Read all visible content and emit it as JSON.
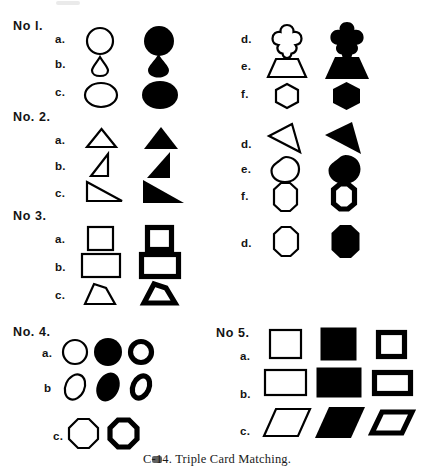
{
  "figure": {
    "caption": "C-14. Triple Card Matching.",
    "ink_color": "#000000",
    "paper_color": "#ffffff"
  },
  "groups": [
    {
      "id": "no-1",
      "label": "No l.",
      "left_column": {
        "rows": [
          {
            "label": "a.",
            "shape": "circle",
            "variants": [
              "outline",
              "solid"
            ]
          },
          {
            "label": "b.",
            "shape": "teardrop",
            "variants": [
              "outline",
              "solid"
            ]
          },
          {
            "label": "c.",
            "shape": "ellipse",
            "variants": [
              "outline",
              "solid"
            ]
          }
        ]
      },
      "right_column": {
        "rows": [
          {
            "label": "d.",
            "shape": "quatrefoil",
            "variants": [
              "outline",
              "solid"
            ]
          },
          {
            "label": "e.",
            "shape": "trapezoid",
            "variants": [
              "outline",
              "solid"
            ]
          },
          {
            "label": "f.",
            "shape": "hexagon",
            "variants": [
              "outline",
              "solid"
            ]
          }
        ]
      }
    },
    {
      "id": "no-2",
      "label": "No. 2.",
      "left_column": {
        "rows": [
          {
            "label": "a.",
            "shape": "triangle-isosceles",
            "variants": [
              "outline",
              "solid"
            ]
          },
          {
            "label": "b.",
            "shape": "triangle-right-narrow",
            "variants": [
              "outline",
              "solid"
            ]
          },
          {
            "label": "c.",
            "shape": "triangle-right-wide",
            "variants": [
              "outline",
              "solid"
            ]
          }
        ]
      },
      "right_column": {
        "rows": [
          {
            "label": "d.",
            "shape": "triangle-sliver",
            "variants": [
              "outline",
              "solid"
            ]
          },
          {
            "label": "e.",
            "shape": "blob-round",
            "variants": [
              "outline",
              "solid"
            ]
          },
          {
            "label": "f.",
            "shape": "octagon-tall",
            "variants": [
              "outline",
              "thick-outline"
            ]
          }
        ]
      }
    },
    {
      "id": "no-3",
      "label": "No 3.",
      "left_column": {
        "rows": [
          {
            "label": "a.",
            "shape": "square",
            "variants": [
              "outline",
              "thick-outline"
            ]
          },
          {
            "label": "b.",
            "shape": "rectangle",
            "variants": [
              "outline",
              "thick-outline"
            ]
          },
          {
            "label": "c.",
            "shape": "quadrilateral-hump",
            "variants": [
              "outline",
              "thick-outline"
            ]
          }
        ]
      },
      "right_column": {
        "rows": [
          {
            "label": "d.",
            "shape": "octagon-tall",
            "variants": [
              "outline",
              "solid"
            ]
          }
        ]
      }
    },
    {
      "id": "no-4",
      "label": "No. 4.",
      "rows": [
        {
          "label": "a.",
          "shape": "circle",
          "variants": [
            "outline",
            "solid",
            "thick-outline"
          ]
        },
        {
          "label": "b",
          "shape": "ellipse-tilted",
          "variants": [
            "outline",
            "solid",
            "thick-outline"
          ]
        },
        {
          "label": "c.",
          "shape": "octagon",
          "variants": [
            "outline",
            "thick-outline"
          ]
        }
      ]
    },
    {
      "id": "no-5",
      "label": "No 5.",
      "rows": [
        {
          "label": "a.",
          "shape": "square",
          "variants": [
            "outline",
            "solid",
            "thick-outline"
          ]
        },
        {
          "label": "b.",
          "shape": "rectangle",
          "variants": [
            "outline",
            "solid",
            "thick-outline"
          ]
        },
        {
          "label": "c.",
          "shape": "parallelogram",
          "variants": [
            "outline",
            "solid",
            "thick-outline"
          ]
        }
      ]
    }
  ]
}
